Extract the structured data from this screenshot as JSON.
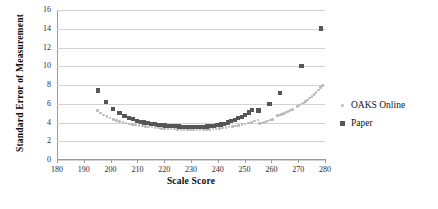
{
  "chart_data": {
    "type": "scatter",
    "title": "",
    "xlabel": "Scale Score",
    "ylabel": "Standard Error of Measurement",
    "xlim": [
      180,
      280
    ],
    "ylim": [
      0,
      16
    ],
    "xticks": [
      180,
      190,
      200,
      210,
      220,
      230,
      240,
      250,
      260,
      270,
      280
    ],
    "yticks": [
      0,
      2,
      4,
      6,
      8,
      10,
      12,
      14,
      16
    ],
    "grid": "horizontal",
    "legend_position": "right",
    "series": [
      {
        "name": "OAKS Online",
        "color": "#b9b9b9",
        "marker": "circle",
        "points": [
          [
            195.2,
            5.3
          ],
          [
            196.3,
            5.0
          ],
          [
            197.4,
            4.8
          ],
          [
            198.6,
            4.62
          ],
          [
            199.8,
            4.48
          ],
          [
            201.0,
            4.34
          ],
          [
            202.2,
            4.22
          ],
          [
            203.4,
            4.12
          ],
          [
            204.6,
            4.02
          ],
          [
            205.8,
            3.94
          ],
          [
            207.0,
            3.86
          ],
          [
            208.2,
            3.8
          ],
          [
            209.4,
            3.74
          ],
          [
            210.6,
            3.68
          ],
          [
            211.8,
            3.63
          ],
          [
            213.0,
            3.58
          ],
          [
            214.2,
            3.54
          ],
          [
            215.4,
            3.5
          ],
          [
            216.6,
            3.46
          ],
          [
            217.8,
            3.42
          ],
          [
            219.0,
            3.39
          ],
          [
            220.2,
            3.36
          ],
          [
            221.4,
            3.33
          ],
          [
            222.6,
            3.31
          ],
          [
            223.8,
            3.29
          ],
          [
            225.0,
            3.27
          ],
          [
            226.2,
            3.25
          ],
          [
            227.4,
            3.24
          ],
          [
            228.6,
            3.23
          ],
          [
            229.8,
            3.22
          ],
          [
            231.0,
            3.22
          ],
          [
            232.2,
            3.22
          ],
          [
            233.4,
            3.23
          ],
          [
            234.6,
            3.24
          ],
          [
            235.8,
            3.26
          ],
          [
            237.0,
            3.28
          ],
          [
            238.2,
            3.31
          ],
          [
            239.4,
            3.34
          ],
          [
            240.6,
            3.38
          ],
          [
            241.8,
            3.42
          ],
          [
            243.0,
            3.47
          ],
          [
            244.2,
            3.52
          ],
          [
            245.4,
            3.58
          ],
          [
            246.6,
            3.64
          ],
          [
            247.8,
            3.71
          ],
          [
            249.0,
            3.78
          ],
          [
            250.2,
            3.86
          ],
          [
            251.4,
            3.94
          ],
          [
            252.6,
            4.03
          ],
          [
            253.8,
            4.14
          ],
          [
            255.0,
            4.26
          ],
          [
            255.6,
            3.9
          ],
          [
            256.4,
            3.94
          ],
          [
            257.2,
            4.02
          ],
          [
            258.0,
            4.1
          ],
          [
            258.8,
            4.18
          ],
          [
            259.6,
            4.26
          ],
          [
            260.4,
            4.34
          ],
          [
            262.2,
            4.72
          ],
          [
            263.0,
            4.8
          ],
          [
            263.8,
            4.88
          ],
          [
            264.6,
            4.98
          ],
          [
            265.4,
            5.08
          ],
          [
            266.2,
            5.18
          ],
          [
            267.0,
            5.28
          ],
          [
            267.8,
            5.4
          ],
          [
            269.5,
            5.7
          ],
          [
            270.3,
            5.82
          ],
          [
            271.1,
            5.96
          ],
          [
            271.9,
            6.1
          ],
          [
            272.7,
            6.26
          ],
          [
            273.5,
            6.42
          ],
          [
            274.3,
            6.6
          ],
          [
            275.1,
            6.8
          ],
          [
            275.9,
            7.0
          ],
          [
            276.7,
            7.22
          ],
          [
            277.5,
            7.46
          ],
          [
            278.3,
            7.72
          ],
          [
            279.0,
            7.95
          ]
        ]
      },
      {
        "name": "Paper",
        "color": "#565656",
        "marker": "square",
        "points": [
          [
            195.3,
            7.42
          ],
          [
            198.2,
            6.18
          ],
          [
            200.8,
            5.42
          ],
          [
            203.3,
            5.02
          ],
          [
            205.2,
            4.72
          ],
          [
            206.9,
            4.5
          ],
          [
            208.4,
            4.34
          ],
          [
            209.8,
            4.2
          ],
          [
            211.2,
            4.08
          ],
          [
            212.5,
            3.99
          ],
          [
            213.8,
            3.92
          ],
          [
            215.1,
            3.86
          ],
          [
            216.4,
            3.8
          ],
          [
            217.7,
            3.76
          ],
          [
            219.0,
            3.72
          ],
          [
            220.3,
            3.68
          ],
          [
            221.6,
            3.65
          ],
          [
            222.9,
            3.62
          ],
          [
            224.2,
            3.6
          ],
          [
            225.5,
            3.58
          ],
          [
            226.8,
            3.56
          ],
          [
            228.1,
            3.55
          ],
          [
            229.4,
            3.54
          ],
          [
            230.7,
            3.54
          ],
          [
            232.0,
            3.54
          ],
          [
            233.3,
            3.54
          ],
          [
            234.6,
            3.55
          ],
          [
            235.9,
            3.57
          ],
          [
            237.2,
            3.6
          ],
          [
            238.5,
            3.64
          ],
          [
            239.8,
            3.7
          ],
          [
            241.1,
            3.78
          ],
          [
            242.4,
            3.88
          ],
          [
            243.7,
            4.0
          ],
          [
            245.0,
            4.14
          ],
          [
            246.3,
            4.28
          ],
          [
            247.6,
            4.44
          ],
          [
            248.9,
            4.62
          ],
          [
            250.2,
            4.82
          ],
          [
            251.5,
            5.06
          ],
          [
            252.8,
            5.34
          ],
          [
            255.2,
            5.28
          ],
          [
            259.3,
            5.98
          ],
          [
            263.2,
            7.18
          ],
          [
            271.2,
            10.02
          ],
          [
            278.6,
            14.02
          ]
        ]
      }
    ]
  },
  "legend": {
    "items": [
      {
        "label": "OAKS Online",
        "marker": "circle-marker",
        "color": "#b9b9b9"
      },
      {
        "label": "Paper",
        "marker": "square-marker",
        "color": "#565656"
      }
    ]
  }
}
